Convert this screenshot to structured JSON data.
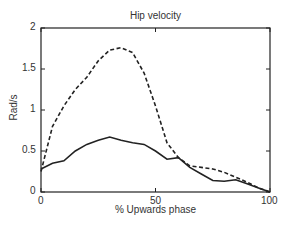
{
  "chart_data": {
    "type": "line",
    "title": "Hip velocity",
    "xlabel": "% Upwards phase",
    "ylabel": "Rad/s",
    "xlim": [
      0,
      100
    ],
    "ylim": [
      0,
      2
    ],
    "xticks": [
      "0",
      "50",
      "100"
    ],
    "yticks": [
      "0",
      "0.5",
      "1",
      "1.5",
      "2"
    ],
    "grid": false,
    "legend": null,
    "x": [
      0,
      5,
      10,
      15,
      20,
      25,
      30,
      35,
      40,
      45,
      50,
      55,
      60,
      65,
      70,
      75,
      80,
      85,
      90,
      95,
      100
    ],
    "series": [
      {
        "name": "dashed",
        "style": "dashed",
        "values": [
          0.25,
          0.8,
          1.05,
          1.25,
          1.4,
          1.6,
          1.73,
          1.76,
          1.7,
          1.45,
          1.05,
          0.6,
          0.42,
          0.32,
          0.3,
          0.28,
          0.24,
          0.18,
          0.12,
          0.05,
          0.0
        ]
      },
      {
        "name": "solid",
        "style": "solid",
        "values": [
          0.28,
          0.35,
          0.38,
          0.5,
          0.58,
          0.63,
          0.67,
          0.63,
          0.6,
          0.58,
          0.5,
          0.4,
          0.42,
          0.3,
          0.22,
          0.14,
          0.13,
          0.15,
          0.1,
          0.05,
          0.0
        ]
      }
    ]
  }
}
